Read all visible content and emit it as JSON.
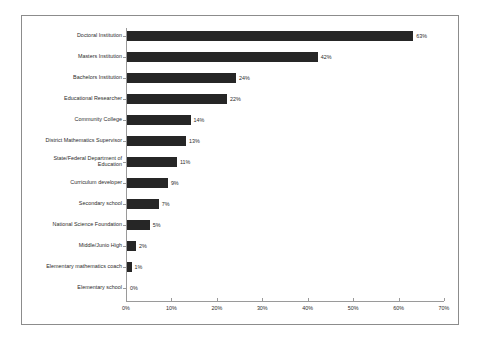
{
  "chart_data": {
    "type": "bar",
    "orientation": "horizontal",
    "title": "",
    "xlabel": "",
    "ylabel": "",
    "xlim": [
      0,
      70
    ],
    "grid": false,
    "legend": null,
    "bar_color": "#262626",
    "axis_color": "#9a9a9a",
    "border_color": "#8c8c8c",
    "background_color": "#ffffff",
    "xticks": [
      "0%",
      "10%",
      "20%",
      "30%",
      "40%",
      "50%",
      "60%",
      "70%"
    ],
    "xtick_values": [
      0,
      10,
      20,
      30,
      40,
      50,
      60,
      70
    ],
    "categories": [
      "Doctoral Institution",
      "Masters Institution",
      "Bachelors Institution",
      "Educational Researcher",
      "Community College",
      "District Mathematics Supervisor",
      "State/Federal Department of\nEducation",
      "Curriculum developer",
      "Secondary school",
      "National Science Foundation",
      "Middle/Junio High",
      "Elementary mathematics coach",
      "Elementary school"
    ],
    "values": [
      63,
      42,
      24,
      22,
      14,
      13,
      11,
      9,
      7,
      5,
      2,
      1,
      0
    ],
    "data_labels": [
      "63%",
      "42%",
      "24%",
      "22%",
      "14%",
      "13%",
      "11%",
      "9%",
      "7%",
      "5%",
      "2%",
      "1%",
      "0%"
    ]
  }
}
